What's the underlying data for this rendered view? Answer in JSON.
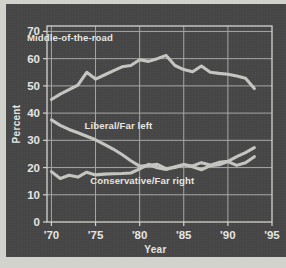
{
  "figure": {
    "background_color": "#d2d2cd",
    "panel_color": "#474747",
    "line_color": "#c8c8c4",
    "grid_color": "#a9a9a6",
    "text_color": "#e9e9e6"
  },
  "chart_data": {
    "type": "line",
    "title": "",
    "xlabel": "Year",
    "ylabel": "Percent",
    "xlim": [
      1969.5,
      1995
    ],
    "ylim": [
      0,
      72
    ],
    "xticks": [
      1970,
      1975,
      1980,
      1985,
      1990,
      1995
    ],
    "xticklabels": [
      "'70",
      "'75",
      "'80",
      "'85",
      "'90",
      "'95"
    ],
    "yticks": [
      0,
      10,
      20,
      30,
      40,
      50,
      60,
      70
    ],
    "yticklabels": [
      "0",
      "10",
      "20",
      "30",
      "40",
      "50",
      "60",
      "70"
    ],
    "grid": true,
    "legend": "inline-annotations",
    "x": [
      1970,
      1971,
      1972,
      1973,
      1974,
      1975,
      1976,
      1977,
      1978,
      1979,
      1980,
      1981,
      1982,
      1983,
      1984,
      1985,
      1986,
      1987,
      1988,
      1989,
      1990,
      1991,
      1992,
      1993
    ],
    "series": [
      {
        "name": "Middle-of-the-road",
        "label": "Middle-of-the-road",
        "label_x": 1972.1,
        "label_y": 66.5,
        "values": [
          45.0,
          47.0,
          48.6,
          50.3,
          55.0,
          52.5,
          54.0,
          55.5,
          57.0,
          57.5,
          59.6,
          59.0,
          60.0,
          61.2,
          57.5,
          56.0,
          55.2,
          57.3,
          55.0,
          54.6,
          54.3,
          53.6,
          52.8,
          49.0
        ]
      },
      {
        "name": "Liberal/Far left",
        "label": "Liberal/Far left",
        "label_x": 1977.6,
        "label_y": 34.0,
        "values": [
          37.5,
          35.5,
          34.0,
          32.8,
          31.5,
          30.2,
          28.5,
          26.8,
          24.8,
          22.5,
          20.5,
          20.8,
          21.2,
          19.6,
          20.0,
          21.0,
          20.6,
          21.8,
          20.9,
          21.9,
          22.3,
          24.0,
          25.5,
          27.3
        ]
      },
      {
        "name": "Conservative/Far right",
        "label": "Conservative/Far right",
        "label_x": 1980.3,
        "label_y": 13.8,
        "values": [
          18.5,
          16.0,
          17.2,
          16.5,
          18.3,
          17.3,
          17.6,
          17.7,
          17.8,
          18.0,
          19.5,
          21.2,
          19.9,
          19.3,
          20.3,
          21.1,
          20.3,
          19.2,
          20.7,
          21.0,
          22.2,
          20.8,
          21.8,
          24.0
        ]
      }
    ]
  }
}
